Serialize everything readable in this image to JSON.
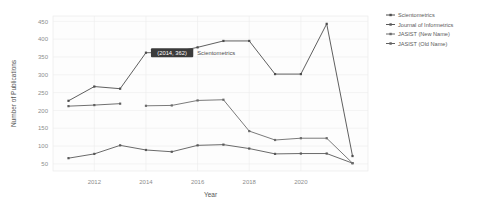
{
  "chart_data": {
    "type": "line",
    "title": "",
    "xlabel": "Year",
    "ylabel": "Number of Publications",
    "xlim": [
      2010.4,
      2022.6
    ],
    "ylim": [
      30,
      465
    ],
    "grid": true,
    "legend_position": "right",
    "xticks": [
      2012,
      2014,
      2016,
      2018,
      2020
    ],
    "xticklabels": [
      "2012",
      "2014",
      "2016",
      "2018",
      "2020"
    ],
    "yticks": [
      50,
      100,
      150,
      200,
      250,
      300,
      350,
      400,
      450
    ],
    "yticklabels": [
      "50",
      "100",
      "150",
      "200",
      "250",
      "300",
      "350",
      "400",
      "450"
    ],
    "series": [
      {
        "name": "Scientometrics",
        "color": "#4d4d4d",
        "x": [
          2011,
          2012,
          2013,
          2014,
          2015,
          2016,
          2017,
          2018,
          2019,
          2020,
          2021,
          2022
        ],
        "values": [
          227,
          267,
          261,
          362,
          362,
          377,
          395,
          395,
          302,
          302,
          443,
          72
        ]
      },
      {
        "name": "Journal of Informetrics",
        "color": "#595959",
        "x": [
          2011,
          2012,
          2013,
          2014,
          2015,
          2016,
          2017,
          2018,
          2019,
          2020,
          2021,
          2022
        ],
        "values": [
          66,
          78,
          102,
          89,
          84,
          102,
          104,
          93,
          78,
          79,
          79,
          52
        ]
      },
      {
        "name": "JASIST (New Name)",
        "color": "#6b6b6b",
        "x": [
          2014,
          2015,
          2016,
          2017,
          2018,
          2019,
          2020,
          2021,
          2022
        ],
        "values": [
          213,
          214,
          228,
          230,
          142,
          117,
          122,
          122,
          52
        ]
      },
      {
        "name": "JASIST (Old Name)",
        "color": "#606060",
        "x": [
          2011,
          2012,
          2013
        ],
        "values": [
          212,
          215,
          219
        ]
      }
    ],
    "annotation": {
      "box_text": "(2014, 362)",
      "label_text": "Scientometrics",
      "point_x": 2014,
      "point_y": 362,
      "box_bg": "#3b3b3b",
      "box_fg": "#ffffff"
    }
  },
  "legend": {
    "entries": [
      {
        "label": "Scientometrics"
      },
      {
        "label": "Journal of Informetrics"
      },
      {
        "label": "JASIST (New Name)"
      },
      {
        "label": "JASIST (Old Name)"
      }
    ]
  }
}
